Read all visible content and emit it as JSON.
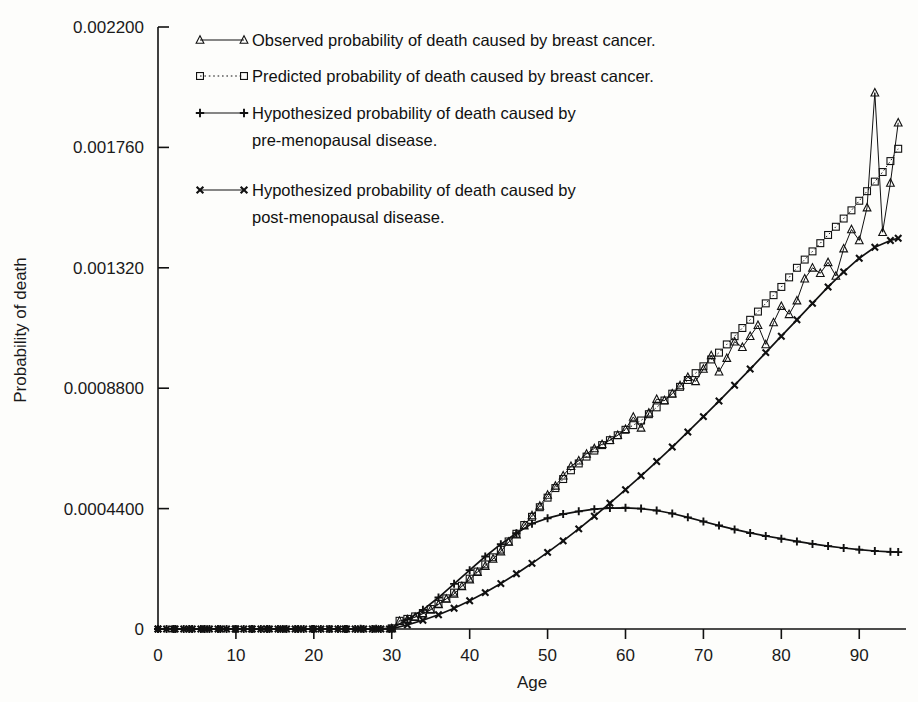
{
  "chart_data": {
    "type": "line",
    "title": "",
    "xlabel": "Age",
    "ylabel": "Probability of death",
    "xlim": [
      0,
      96
    ],
    "ylim": [
      0,
      0.0022
    ],
    "grid": false,
    "legend_position": "top-left-inside",
    "xticks": [
      0,
      10,
      20,
      30,
      40,
      50,
      60,
      70,
      80,
      90
    ],
    "xtick_labels": [
      "0",
      "10",
      "20",
      "30",
      "40",
      "50",
      "60",
      "70",
      "80",
      "90"
    ],
    "yticks": [
      0,
      0.00044,
      0.00088,
      0.00132,
      0.00176,
      0.0022
    ],
    "ytick_labels": [
      "0",
      "0.0004400",
      "0.0008800",
      "0.001320",
      "0.001760",
      "0.002200"
    ],
    "series": [
      {
        "name": "Observed probability of death caused by breast cancer.",
        "marker": "triangle",
        "line": "solid",
        "x": [
          0,
          2,
          4,
          6,
          8,
          10,
          12,
          14,
          16,
          18,
          20,
          22,
          24,
          26,
          28,
          30,
          31,
          32,
          33,
          34,
          35,
          36,
          37,
          38,
          39,
          40,
          41,
          42,
          43,
          44,
          45,
          46,
          47,
          48,
          49,
          50,
          51,
          52,
          53,
          54,
          55,
          56,
          57,
          58,
          59,
          60,
          61,
          62,
          63,
          64,
          65,
          66,
          67,
          68,
          69,
          70,
          71,
          72,
          73,
          74,
          75,
          76,
          77,
          78,
          79,
          80,
          81,
          82,
          83,
          84,
          85,
          86,
          87,
          88,
          89,
          90,
          91,
          92,
          93,
          94,
          95
        ],
        "y": [
          0.0,
          0.0,
          0.0,
          0.0,
          0.0,
          0.0,
          0.0,
          0.0,
          0.0,
          0.0,
          0.0,
          0.0,
          3e-07,
          6e-07,
          1.2e-06,
          2.2e-06,
          2.9e-05,
          3.5e-05,
          4.3e-05,
          5.6e-05,
          7e-05,
          9e-05,
          0.00011,
          0.000128,
          0.000156,
          0.00018,
          0.000208,
          0.00023,
          0.000256,
          0.000283,
          0.000318,
          0.000345,
          0.000378,
          0.000415,
          0.00045,
          0.00049,
          0.000523,
          0.00056,
          0.000595,
          0.000615,
          0.00064,
          0.00066,
          0.000675,
          0.00069,
          0.000708,
          0.00073,
          0.000775,
          0.000735,
          0.00079,
          0.00084,
          0.000835,
          0.00086,
          0.00089,
          0.00092,
          0.000905,
          0.00095,
          0.001,
          0.00094,
          0.00099,
          0.00105,
          0.00103,
          0.00107,
          0.00111,
          0.00104,
          0.00112,
          0.00118,
          0.00115,
          0.0012,
          0.00128,
          0.00132,
          0.0013,
          0.00134,
          0.00129,
          0.00139,
          0.00146,
          0.00142,
          0.00154,
          0.00196,
          0.00145,
          0.00163,
          0.00185
        ]
      },
      {
        "name": "Predicted probability of death caused by breast cancer.",
        "marker": "square",
        "line": "dotted",
        "x": [
          0,
          2,
          4,
          6,
          8,
          10,
          12,
          14,
          16,
          18,
          20,
          22,
          24,
          26,
          28,
          30,
          31,
          32,
          33,
          34,
          35,
          36,
          37,
          38,
          39,
          40,
          41,
          42,
          43,
          44,
          45,
          46,
          47,
          48,
          49,
          50,
          51,
          52,
          53,
          54,
          55,
          56,
          57,
          58,
          59,
          60,
          61,
          62,
          63,
          64,
          65,
          66,
          67,
          68,
          69,
          70,
          71,
          72,
          73,
          74,
          75,
          76,
          77,
          78,
          79,
          80,
          81,
          82,
          83,
          84,
          85,
          86,
          87,
          88,
          89,
          90,
          91,
          92,
          93,
          94,
          95
        ],
        "y": [
          0.0,
          0.0,
          0.0,
          0.0,
          0.0,
          0.0,
          0.0,
          0.0,
          0.0,
          0.0,
          0.0,
          0.0,
          3e-07,
          7e-07,
          1.4e-06,
          2.5e-06,
          3e-05,
          3.7e-05,
          4.6e-05,
          5.8e-05,
          7.3e-05,
          9.2e-05,
          0.000112,
          0.000133,
          0.000158,
          0.000184,
          0.00021,
          0.000236,
          0.000262,
          0.00029,
          0.00032,
          0.000348,
          0.00038,
          0.00041,
          0.000445,
          0.00048,
          0.000515,
          0.000548,
          0.00058,
          0.000605,
          0.00063,
          0.000652,
          0.000672,
          0.00069,
          0.000708,
          0.000728,
          0.000745,
          0.000762,
          0.000785,
          0.00081,
          0.000835,
          0.00086,
          0.000885,
          0.00091,
          0.000935,
          0.00096,
          0.000985,
          0.00101,
          0.00104,
          0.00107,
          0.0011,
          0.00113,
          0.00116,
          0.00119,
          0.00122,
          0.00125,
          0.001285,
          0.00132,
          0.00135,
          0.00138,
          0.00141,
          0.00144,
          0.00147,
          0.0015,
          0.00153,
          0.001565,
          0.0016,
          0.001635,
          0.00167,
          0.00171,
          0.001755
        ]
      },
      {
        "name": "Hypothesized probability of death caused by pre-menopausal disease.",
        "marker": "plus",
        "line": "solid",
        "x": [
          0,
          2,
          4,
          6,
          8,
          10,
          12,
          14,
          16,
          18,
          20,
          22,
          24,
          26,
          28,
          30,
          32,
          34,
          36,
          38,
          40,
          42,
          44,
          46,
          48,
          50,
          52,
          54,
          56,
          58,
          60,
          62,
          64,
          66,
          68,
          70,
          72,
          74,
          76,
          78,
          80,
          82,
          84,
          86,
          88,
          90,
          92,
          94,
          95
        ],
        "y": [
          0.0,
          0.0,
          0.0,
          0.0,
          0.0,
          0.0,
          0.0,
          0.0,
          0.0,
          0.0,
          0.0,
          0.0,
          2e-07,
          5e-07,
          1e-06,
          2e-06,
          3.5e-05,
          7e-05,
          0.000115,
          0.000165,
          0.000215,
          0.000265,
          0.00031,
          0.00035,
          0.000385,
          0.000405,
          0.00042,
          0.00043,
          0.000438,
          0.000442,
          0.000443,
          0.00044,
          0.000433,
          0.000422,
          0.000408,
          0.000393,
          0.000378,
          0.000364,
          0.000351,
          0.00034,
          0.00033,
          0.00032,
          0.000311,
          0.000303,
          0.000296,
          0.00029,
          0.000285,
          0.000282,
          0.000281
        ]
      },
      {
        "name": "Hypothesized probability of death caused by post-menopausal disease.",
        "marker": "cross",
        "line": "solid",
        "x": [
          0,
          2,
          4,
          6,
          8,
          10,
          12,
          14,
          16,
          18,
          20,
          22,
          24,
          26,
          28,
          30,
          32,
          34,
          36,
          38,
          40,
          42,
          44,
          46,
          48,
          50,
          52,
          54,
          56,
          58,
          60,
          62,
          64,
          66,
          68,
          70,
          72,
          74,
          76,
          78,
          80,
          82,
          84,
          86,
          88,
          90,
          92,
          94,
          95
        ],
        "y": [
          0.0,
          0.0,
          0.0,
          0.0,
          0.0,
          0.0,
          0.0,
          0.0,
          0.0,
          0.0,
          0.0,
          0.0,
          1e-07,
          2e-07,
          5e-07,
          1e-06,
          1.5e-05,
          3.2e-05,
          5.2e-05,
          7.6e-05,
          0.000103,
          0.000133,
          0.000166,
          0.000202,
          0.00024,
          0.00028,
          0.000322,
          0.000366,
          0.000412,
          0.00046,
          0.000509,
          0.00056,
          0.000612,
          0.000665,
          0.00072,
          0.000776,
          0.000833,
          0.000891,
          0.00095,
          0.00101,
          0.00107,
          0.00113,
          0.00119,
          0.00125,
          0.001305,
          0.001355,
          0.001395,
          0.00142,
          0.001428
        ]
      }
    ]
  },
  "legend": {
    "items": [
      {
        "marker": "triangle-marker",
        "line_style": "solid",
        "line1": "Observed probability of death caused by breast cancer.",
        "line2": ""
      },
      {
        "marker": "square-marker",
        "line_style": "dotted",
        "line1": "Predicted probability of death caused by breast cancer.",
        "line2": ""
      },
      {
        "marker": "plus-marker",
        "line_style": "solid",
        "line1": "Hypothesized probability of death caused by",
        "line2": "pre-menopausal disease."
      },
      {
        "marker": "cross-marker",
        "line_style": "solid",
        "line1": "Hypothesized probability of death caused by",
        "line2": "post-menopausal disease."
      }
    ]
  },
  "colors": {
    "ink": "#111111",
    "background": "#fdfdfb"
  }
}
